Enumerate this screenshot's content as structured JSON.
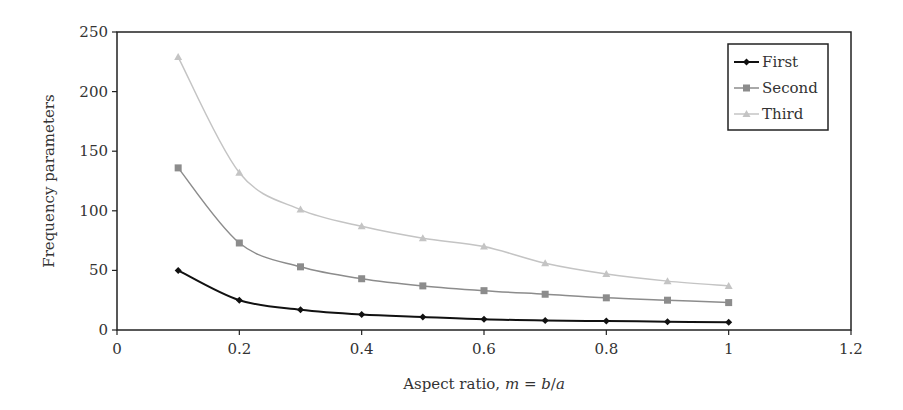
{
  "chart_data": {
    "type": "line",
    "title": "",
    "xlabel": "Aspect ratio, m = b/a",
    "xlabel_parts": {
      "prefix": "Aspect ratio, ",
      "var_m": "m",
      "eq": " = ",
      "var_b": "b",
      "slash": "/",
      "var_a": "a"
    },
    "ylabel": "Frequency parameters",
    "xlim": [
      0,
      1.2
    ],
    "ylim": [
      0,
      250
    ],
    "xticks": [
      0,
      0.2,
      0.4,
      0.6,
      0.8,
      1,
      1.2
    ],
    "xtick_labels": [
      "0",
      "0.2",
      "0.4",
      "0.6",
      "0.8",
      "1",
      "1.2"
    ],
    "yticks": [
      0,
      50,
      100,
      150,
      200,
      250
    ],
    "ytick_labels": [
      "0",
      "50",
      "100",
      "150",
      "200",
      "250"
    ],
    "grid": false,
    "legend_position": "upper right",
    "x": [
      0.1,
      0.2,
      0.3,
      0.4,
      0.5,
      0.6,
      0.7,
      0.8,
      0.9,
      1.0
    ],
    "series": [
      {
        "name": "First",
        "marker": "diamond",
        "color": "#111111",
        "values": [
          50,
          25,
          17,
          13,
          11,
          9,
          8,
          7.5,
          7,
          6.5
        ]
      },
      {
        "name": "Second",
        "marker": "square",
        "color": "#8c8c8c",
        "values": [
          136,
          73,
          53,
          43,
          37,
          33,
          30,
          27,
          25,
          23
        ]
      },
      {
        "name": "Third",
        "marker": "triangle",
        "color": "#c4c4c4",
        "values": [
          229,
          132,
          101,
          87,
          77,
          70,
          56,
          47,
          41,
          37
        ]
      }
    ]
  }
}
